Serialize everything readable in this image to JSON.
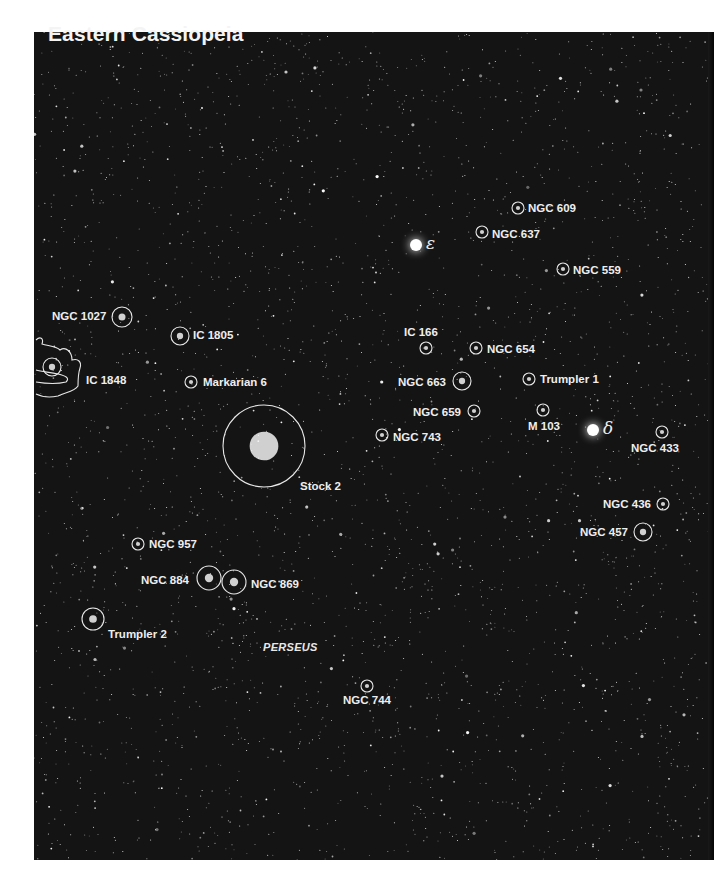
{
  "title": "Eastern Cassiopeia",
  "constellation_label": "PERSEUS",
  "stars": [
    {
      "name": "epsilon",
      "symbol": "ε",
      "x": 416,
      "y": 245
    },
    {
      "name": "delta",
      "symbol": "δ",
      "x": 593,
      "y": 430
    }
  ],
  "objects": [
    {
      "id": "ngc609",
      "label": "NGC 609",
      "cx": 518,
      "cy": 208,
      "r": 6,
      "lx": 528,
      "ly": 202
    },
    {
      "id": "ngc637",
      "label": "NGC 637",
      "cx": 482,
      "cy": 232,
      "r": 6,
      "lx": 492,
      "ly": 228
    },
    {
      "id": "ngc559",
      "label": "NGC 559",
      "cx": 563,
      "cy": 269,
      "r": 6,
      "lx": 573,
      "ly": 264
    },
    {
      "id": "ngc1027",
      "label": "NGC 1027",
      "cx": 122,
      "cy": 317,
      "r": 10,
      "lx": 52,
      "ly": 310
    },
    {
      "id": "ic1805",
      "label": "IC 1805",
      "cx": 180,
      "cy": 336,
      "r": 9,
      "lx": 193,
      "ly": 329
    },
    {
      "id": "ic166",
      "label": "IC 166",
      "cx": 426,
      "cy": 348,
      "r": 6,
      "lx": 404,
      "ly": 326
    },
    {
      "id": "ngc654",
      "label": "NGC 654",
      "cx": 476,
      "cy": 348,
      "r": 6,
      "lx": 487,
      "ly": 343
    },
    {
      "id": "ic1848",
      "label": "IC 1848",
      "cx": 52,
      "cy": 367,
      "r": 9,
      "lx": 86,
      "ly": 374
    },
    {
      "id": "markarian6",
      "label": "Markarian 6",
      "cx": 191,
      "cy": 382,
      "r": 6,
      "lx": 203,
      "ly": 376
    },
    {
      "id": "ngc663",
      "label": "NGC 663",
      "cx": 462,
      "cy": 381,
      "r": 9,
      "lx": 398,
      "ly": 376
    },
    {
      "id": "trumpler1",
      "label": "Trumpler 1",
      "cx": 529,
      "cy": 379,
      "r": 6,
      "lx": 540,
      "ly": 373
    },
    {
      "id": "ngc659",
      "label": "NGC 659",
      "cx": 474,
      "cy": 411,
      "r": 6,
      "lx": 413,
      "ly": 406
    },
    {
      "id": "m103",
      "label": "M 103",
      "cx": 543,
      "cy": 410,
      "r": 6,
      "lx": 528,
      "ly": 420
    },
    {
      "id": "ngc743",
      "label": "NGC 743",
      "cx": 382,
      "cy": 435,
      "r": 6,
      "lx": 393,
      "ly": 431
    },
    {
      "id": "ngc433",
      "label": "NGC 433",
      "cx": 662,
      "cy": 432,
      "r": 6,
      "lx": 631,
      "ly": 442
    },
    {
      "id": "stock2",
      "label": "Stock 2",
      "cx": 264,
      "cy": 446,
      "r": 41,
      "lx": 300,
      "ly": 480
    },
    {
      "id": "ngc436",
      "label": "NGC 436",
      "cx": 663,
      "cy": 504,
      "r": 6,
      "lx": 603,
      "ly": 498
    },
    {
      "id": "ngc457",
      "label": "NGC 457",
      "cx": 643,
      "cy": 532,
      "r": 9,
      "lx": 580,
      "ly": 526
    },
    {
      "id": "ngc957",
      "label": "NGC 957",
      "cx": 138,
      "cy": 544,
      "r": 6,
      "lx": 149,
      "ly": 538
    },
    {
      "id": "ngc884",
      "label": "NGC 884",
      "cx": 209,
      "cy": 578,
      "r": 12,
      "lx": 141,
      "ly": 574
    },
    {
      "id": "ngc869",
      "label": "NGC 869",
      "cx": 234,
      "cy": 582,
      "r": 12,
      "lx": 251,
      "ly": 578
    },
    {
      "id": "trumpler2",
      "label": "Trumpler 2",
      "cx": 93,
      "cy": 619,
      "r": 11,
      "lx": 108,
      "ly": 628
    },
    {
      "id": "ngc744",
      "label": "NGC 744",
      "cx": 367,
      "cy": 686,
      "r": 6,
      "lx": 343,
      "ly": 694
    }
  ],
  "colors": {
    "sky": "#141414",
    "annotation": "#eeeeee",
    "page": "#ffffff"
  }
}
